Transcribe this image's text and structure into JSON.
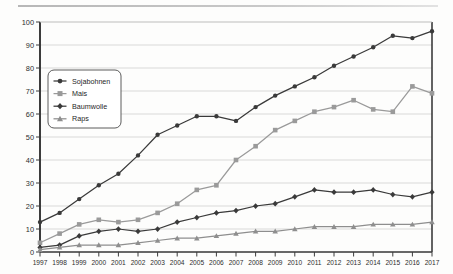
{
  "chart_data": {
    "type": "line",
    "title": "",
    "subtitle": "",
    "xlabel": "",
    "ylabel": "",
    "categories": [
      "1997",
      "1998",
      "1999",
      "2000",
      "2001",
      "2002",
      "2003",
      "2004",
      "2005",
      "2006",
      "2007",
      "2008",
      "2009",
      "2010",
      "2011",
      "2012",
      "2013",
      "2014",
      "2015",
      "2016",
      "2017"
    ],
    "x": [
      1997,
      1998,
      1999,
      2000,
      2001,
      2002,
      2003,
      2004,
      2005,
      2006,
      2007,
      2008,
      2009,
      2010,
      2011,
      2012,
      2013,
      2014,
      2015,
      2016,
      2017
    ],
    "xlim": [
      1997,
      2017
    ],
    "ylim": [
      0,
      100
    ],
    "yticks": [
      0,
      10,
      20,
      30,
      40,
      50,
      60,
      70,
      80,
      90,
      100
    ],
    "ytick_labels": [
      "0",
      "10",
      "20",
      "30",
      "40",
      "50",
      "60",
      "70",
      "80",
      "90",
      "100"
    ],
    "grid": "horizontal",
    "legend_position": "upper-left-inside",
    "series": [
      {
        "name": "Sojabohnen",
        "marker": "circle",
        "color": "#3a3a3a",
        "values": [
          13,
          17,
          23,
          29,
          34,
          42,
          51,
          55,
          59,
          59,
          57,
          63,
          68,
          72,
          76,
          81,
          85,
          89,
          94,
          93,
          96
        ]
      },
      {
        "name": "Mais",
        "marker": "square",
        "color": "#9a9a9a",
        "values": [
          4,
          8,
          12,
          14,
          13,
          14,
          17,
          21,
          27,
          29,
          40,
          46,
          53,
          57,
          61,
          63,
          66,
          62,
          61,
          72,
          69
        ]
      },
      {
        "name": "Baumwolle",
        "marker": "diamond",
        "color": "#3a3a3a",
        "values": [
          2,
          3,
          7,
          9,
          10,
          9,
          10,
          13,
          15,
          17,
          18,
          20,
          21,
          24,
          27,
          26,
          26,
          27,
          25,
          24,
          26
        ]
      },
      {
        "name": "Raps",
        "marker": "triangle",
        "color": "#8e8e8e",
        "values": [
          1,
          2,
          3,
          3,
          3,
          4,
          5,
          6,
          6,
          7,
          8,
          9,
          9,
          10,
          11,
          11,
          11,
          12,
          12,
          12,
          13
        ]
      }
    ]
  },
  "legend": {
    "items": [
      {
        "label": "Sojabohnen"
      },
      {
        "label": "Mais"
      },
      {
        "label": "Baumwolle"
      },
      {
        "label": "Raps"
      }
    ]
  },
  "colors": {
    "axis": "#3c3c3c",
    "grid": "#c8c8c8",
    "dark_series": "#3a3a3a",
    "light_series": "#9a9a9a",
    "background": "#fdfdfc"
  }
}
